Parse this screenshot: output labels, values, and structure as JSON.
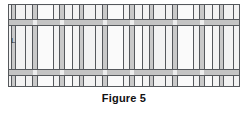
{
  "figure": {
    "caption": "Figure 5",
    "dimension_label": "L",
    "colors": {
      "line": "#55585c",
      "member_fill": "#c9c9c9",
      "band_fill": "#c4c4c4",
      "wash": "#f2f2f2",
      "panel": "#fafafa",
      "node": "#ededed",
      "background": "#ffffff",
      "text": "#111111"
    },
    "frame": {
      "x": 8,
      "y": 4,
      "width": 232,
      "height": 83
    },
    "diagram": {
      "type": "structural-elevation",
      "bay_count": 3,
      "description": "Framed wall elevation with three repeating bays separated by vertical wall strips and crossed by two horizontal beam bands"
    },
    "horizontal_bands": [
      {
        "name": "upper-beam-band",
        "top": 14,
        "height": 7
      },
      {
        "name": "lower-beam-band",
        "top": 64,
        "height": 7
      }
    ],
    "vertical_members": [
      {
        "name": "wall-strip-1",
        "left": 2,
        "width": 5
      },
      {
        "name": "grid-line-1",
        "left": 16
      },
      {
        "name": "wall-strip-2",
        "left": 23,
        "width": 6
      },
      {
        "name": "grid-line-2",
        "left": 44
      },
      {
        "name": "wall-strip-3",
        "left": 50,
        "width": 6
      },
      {
        "name": "grid-line-3",
        "left": 63
      },
      {
        "name": "wall-strip-4",
        "left": 70,
        "width": 5
      },
      {
        "name": "grid-line-4",
        "left": 86
      },
      {
        "name": "wall-strip-5",
        "left": 93,
        "width": 6
      },
      {
        "name": "grid-line-5",
        "left": 114
      },
      {
        "name": "wall-strip-6",
        "left": 120,
        "width": 6
      },
      {
        "name": "grid-line-6",
        "left": 133
      },
      {
        "name": "wall-strip-7",
        "left": 140,
        "width": 5
      },
      {
        "name": "grid-line-7",
        "left": 156
      },
      {
        "name": "wall-strip-8",
        "left": 163,
        "width": 6
      },
      {
        "name": "grid-line-8",
        "left": 184
      },
      {
        "name": "wall-strip-9",
        "left": 190,
        "width": 6
      },
      {
        "name": "grid-line-9",
        "left": 203
      },
      {
        "name": "wall-strip-10",
        "left": 210,
        "width": 5
      },
      {
        "name": "grid-line-10",
        "left": 224
      }
    ],
    "infill_panels": [
      {
        "name": "panel-bay1-upper",
        "left": 29,
        "top": 1,
        "width": 15,
        "height": 13
      },
      {
        "name": "panel-bay1-mid",
        "left": 29,
        "top": 21,
        "width": 15,
        "height": 43
      },
      {
        "name": "panel-bay1-lower",
        "left": 29,
        "top": 71,
        "width": 15,
        "height": 11
      },
      {
        "name": "panel-bay1b-mid",
        "left": 56,
        "top": 21,
        "width": 7,
        "height": 43
      },
      {
        "name": "panel-bay1b-low",
        "left": 56,
        "top": 71,
        "width": 7,
        "height": 11
      },
      {
        "name": "panel-bay2-upper",
        "left": 99,
        "top": 1,
        "width": 15,
        "height": 13
      },
      {
        "name": "panel-bay2-mid",
        "left": 99,
        "top": 21,
        "width": 15,
        "height": 43
      },
      {
        "name": "panel-bay2-lower",
        "left": 99,
        "top": 71,
        "width": 15,
        "height": 11
      },
      {
        "name": "panel-bay2b-mid",
        "left": 126,
        "top": 21,
        "width": 7,
        "height": 43
      },
      {
        "name": "panel-bay2b-low",
        "left": 126,
        "top": 71,
        "width": 7,
        "height": 11
      },
      {
        "name": "panel-bay3-upper",
        "left": 169,
        "top": 1,
        "width": 15,
        "height": 13
      },
      {
        "name": "panel-bay3-mid",
        "left": 169,
        "top": 21,
        "width": 15,
        "height": 43
      },
      {
        "name": "panel-bay3-lower",
        "left": 169,
        "top": 71,
        "width": 15,
        "height": 11
      },
      {
        "name": "panel-bay3b-mid",
        "left": 196,
        "top": 21,
        "width": 7,
        "height": 43
      },
      {
        "name": "panel-bay3b-low",
        "left": 196,
        "top": 71,
        "width": 7,
        "height": 11
      }
    ],
    "joint_nodes": [
      {
        "name": "node-u1",
        "left": 24,
        "top": 15,
        "width": 4,
        "height": 5
      },
      {
        "name": "node-u2",
        "left": 51,
        "top": 15,
        "width": 4,
        "height": 5
      },
      {
        "name": "node-u3",
        "left": 94,
        "top": 15,
        "width": 4,
        "height": 5
      },
      {
        "name": "node-u4",
        "left": 121,
        "top": 15,
        "width": 4,
        "height": 5
      },
      {
        "name": "node-u5",
        "left": 164,
        "top": 15,
        "width": 4,
        "height": 5
      },
      {
        "name": "node-u6",
        "left": 191,
        "top": 15,
        "width": 4,
        "height": 5
      },
      {
        "name": "node-l1",
        "left": 24,
        "top": 65,
        "width": 4,
        "height": 5
      },
      {
        "name": "node-l2",
        "left": 51,
        "top": 65,
        "width": 4,
        "height": 5
      },
      {
        "name": "node-l3",
        "left": 94,
        "top": 65,
        "width": 4,
        "height": 5
      },
      {
        "name": "node-l4",
        "left": 121,
        "top": 65,
        "width": 4,
        "height": 5
      },
      {
        "name": "node-l5",
        "left": 164,
        "top": 65,
        "width": 4,
        "height": 5
      },
      {
        "name": "node-l6",
        "left": 191,
        "top": 65,
        "width": 4,
        "height": 5
      }
    ]
  }
}
